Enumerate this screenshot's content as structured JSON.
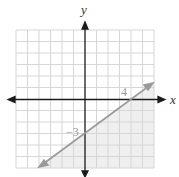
{
  "graph": {
    "x_axis_label": "x",
    "y_axis_label": "y",
    "x_intercept_label": "4",
    "y_intercept_label": "−3",
    "grid_range": [
      -6,
      6
    ],
    "line": {
      "points": [
        [
          4,
          0
        ],
        [
          0,
          -3
        ]
      ],
      "slope": 0.75,
      "intercept": -3
    },
    "shaded_region": "below line",
    "colors": {
      "grid": "#d9d9d9",
      "axis": "#1a1a1a",
      "line": "#999999",
      "shade": "#f0f0f0"
    }
  }
}
